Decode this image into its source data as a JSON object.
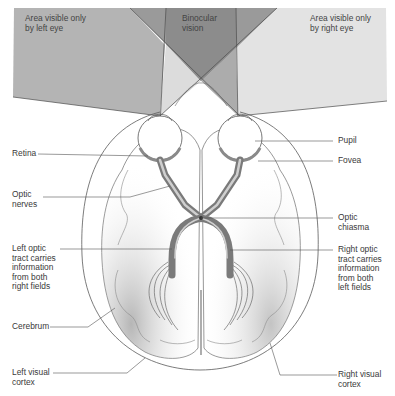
{
  "colors": {
    "left_field": "#b4b4b4",
    "right_field": "#e4e4e4",
    "binocular_dark": "#8e8e8e",
    "binocular_mid": "#a8a8a8",
    "wedge_light": "#dcdcdc",
    "line": "#4a4a4a",
    "tract": "#7a7a7a",
    "tract_inner": "#c8c8c8",
    "brain_shade": "#9a9a9a"
  },
  "fields": {
    "left": "Area visible only\nby left eye",
    "binocular": "Binocular\nvision",
    "right": "Area visible only\nby right eye"
  },
  "labels_left": {
    "retina": "Retina",
    "optic_nerves": "Optic\nnerves",
    "left_optic_tract": "Left optic\ntract carries\ninformation\nfrom both\nright fields",
    "cerebrum": "Cerebrum",
    "left_visual_cortex": "Left visual\ncortex"
  },
  "labels_right": {
    "pupil": "Pupil",
    "fovea": "Fovea",
    "optic_chiasma": "Optic\nchiasma",
    "right_optic_tract": "Right optic\ntract carries\ninformation\nfrom both\nleft fields",
    "right_visual_cortex": "Right visual\ncortex"
  }
}
